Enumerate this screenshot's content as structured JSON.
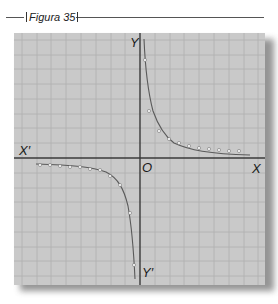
{
  "figure": {
    "caption": "Figura 35",
    "axes": {
      "x_label": "X",
      "x_neg_label": "X′",
      "y_label": "Y",
      "y_neg_label": "Y′",
      "origin_label": "O"
    },
    "curve": "hyperbola (y = k/x), branches in quadrants I and III",
    "colors": {
      "background": "#c9c9c9",
      "grid": "#b3b3b3",
      "axis": "#3a3a3a",
      "curve": "#555555",
      "points": "#f2f2f2"
    }
  }
}
